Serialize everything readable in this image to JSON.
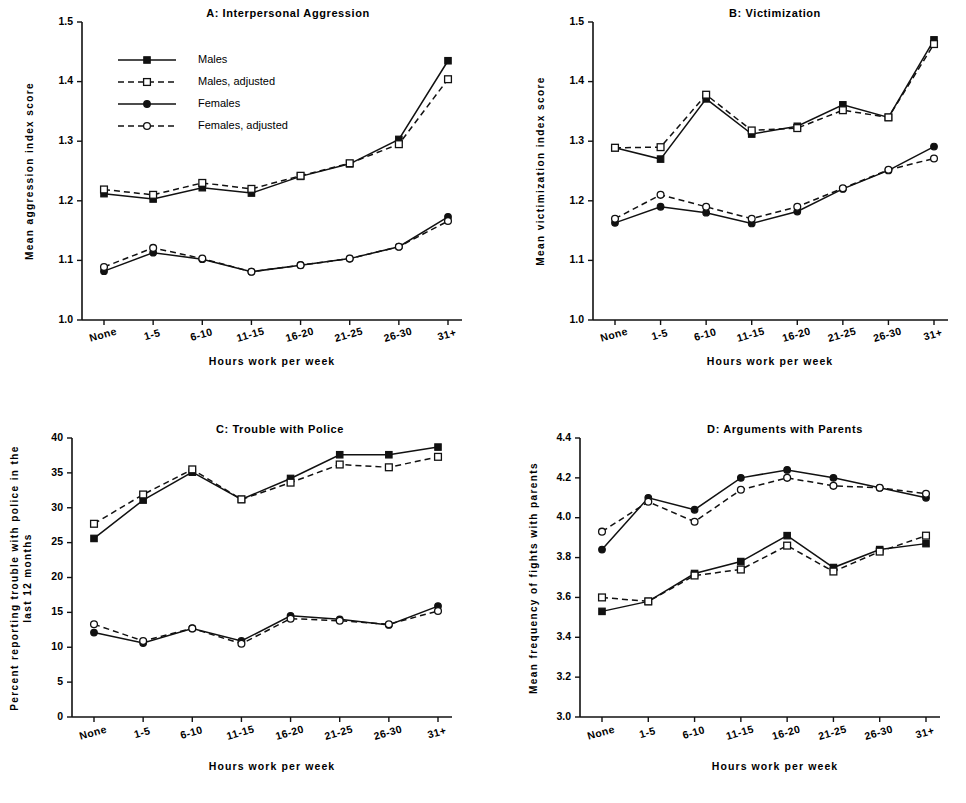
{
  "figure": {
    "shared_xlabel": "Hours work per week",
    "categories": [
      "None",
      "1-5",
      "6-10",
      "11-15",
      "16-20",
      "21-25",
      "26-30",
      "31+"
    ],
    "legend": {
      "items": [
        {
          "label": "Males",
          "marker": "filled-square",
          "line": "solid"
        },
        {
          "label": "Males, adjusted",
          "marker": "open-square",
          "line": "dashed"
        },
        {
          "label": "Females",
          "marker": "filled-circle",
          "line": "solid"
        },
        {
          "label": "Females, adjusted",
          "marker": "open-circle",
          "line": "dashed"
        }
      ]
    },
    "line_color": "#111111"
  },
  "chart_data": [
    {
      "panel": "A",
      "type": "line",
      "title": "A:   Interpersonal Aggression",
      "xlabel": "Hours work per week",
      "ylabel": "Mean aggression index score",
      "categories": [
        "None",
        "1-5",
        "6-10",
        "11-15",
        "16-20",
        "21-25",
        "26-30",
        "31+"
      ],
      "ylim": [
        1.0,
        1.5
      ],
      "yticks": [
        1.0,
        1.1,
        1.2,
        1.3,
        1.4,
        1.5
      ],
      "ytick_labels": [
        "1.0",
        "1.1",
        "1.2",
        "1.3",
        "1.4",
        "1.5"
      ],
      "grid": false,
      "legend_position": "upper-left",
      "series": [
        {
          "name": "Males",
          "marker": "filled-square",
          "line": "solid",
          "values": [
            1.212,
            1.203,
            1.222,
            1.213,
            1.241,
            1.262,
            1.303,
            1.435
          ]
        },
        {
          "name": "Males, adjusted",
          "marker": "open-square",
          "line": "dashed",
          "values": [
            1.219,
            1.21,
            1.23,
            1.22,
            1.242,
            1.263,
            1.295,
            1.404
          ]
        },
        {
          "name": "Females",
          "marker": "filled-circle",
          "line": "solid",
          "values": [
            1.082,
            1.113,
            1.102,
            1.081,
            1.092,
            1.103,
            1.123,
            1.173
          ]
        },
        {
          "name": "Females, adjusted",
          "marker": "open-circle",
          "line": "dashed",
          "values": [
            1.089,
            1.121,
            1.103,
            1.081,
            1.092,
            1.103,
            1.123,
            1.166
          ]
        }
      ]
    },
    {
      "panel": "B",
      "type": "line",
      "title": "B:   Victimization",
      "xlabel": "Hours work per week",
      "ylabel": "Mean victimization index score",
      "categories": [
        "None",
        "1-5",
        "6-10",
        "11-15",
        "16-20",
        "21-25",
        "26-30",
        "31+"
      ],
      "ylim": [
        1.0,
        1.5
      ],
      "yticks": [
        1.0,
        1.1,
        1.2,
        1.3,
        1.4,
        1.5
      ],
      "ytick_labels": [
        "1.0",
        "1.1",
        "1.2",
        "1.3",
        "1.4",
        "1.5"
      ],
      "grid": false,
      "legend_position": "none",
      "series": [
        {
          "name": "Males",
          "marker": "filled-square",
          "line": "solid",
          "values": [
            1.289,
            1.27,
            1.371,
            1.312,
            1.325,
            1.361,
            1.34,
            1.47
          ]
        },
        {
          "name": "Males, adjusted",
          "marker": "open-square",
          "line": "dashed",
          "values": [
            1.289,
            1.29,
            1.378,
            1.318,
            1.322,
            1.352,
            1.34,
            1.463
          ]
        },
        {
          "name": "Females",
          "marker": "filled-circle",
          "line": "solid",
          "values": [
            1.163,
            1.19,
            1.18,
            1.162,
            1.182,
            1.22,
            1.251,
            1.291
          ]
        },
        {
          "name": "Females, adjusted",
          "marker": "open-circle",
          "line": "dashed",
          "values": [
            1.17,
            1.21,
            1.19,
            1.17,
            1.19,
            1.221,
            1.252,
            1.271
          ]
        }
      ]
    },
    {
      "panel": "C",
      "type": "line",
      "title": "C:  Trouble with Police",
      "xlabel": "Hours work per week",
      "ylabel": "Percent reporting trouble with police in the last 12 months",
      "ylabel_lines": [
        "Percent reporting trouble with police in the",
        "last 12 months"
      ],
      "categories": [
        "None",
        "1-5",
        "6-10",
        "11-15",
        "16-20",
        "21-25",
        "26-30",
        "31+"
      ],
      "ylim": [
        0,
        40
      ],
      "yticks": [
        0,
        5,
        10,
        15,
        20,
        25,
        30,
        35,
        40
      ],
      "ytick_labels": [
        "0",
        "5",
        "10",
        "15",
        "20",
        "25",
        "30",
        "35",
        "40"
      ],
      "grid": false,
      "legend_position": "none",
      "series": [
        {
          "name": "Males",
          "marker": "filled-square",
          "line": "solid",
          "values": [
            25.6,
            31.1,
            35.1,
            31.2,
            34.2,
            37.6,
            37.6,
            38.7
          ]
        },
        {
          "name": "Males, adjusted",
          "marker": "open-square",
          "line": "dashed",
          "values": [
            27.7,
            31.9,
            35.5,
            31.2,
            33.6,
            36.2,
            35.8,
            37.3
          ]
        },
        {
          "name": "Females",
          "marker": "filled-circle",
          "line": "solid",
          "values": [
            12.1,
            10.6,
            12.7,
            10.9,
            14.5,
            14.0,
            13.2,
            15.9
          ]
        },
        {
          "name": "Females, adjusted",
          "marker": "open-circle",
          "line": "dashed",
          "values": [
            13.3,
            10.9,
            12.7,
            10.5,
            14.1,
            13.8,
            13.3,
            15.2
          ]
        }
      ]
    },
    {
      "panel": "D",
      "type": "line",
      "title": "D:   Arguments with Parents",
      "xlabel": "Hours work per week",
      "ylabel": "Mean frequency of fights with parents",
      "categories": [
        "None",
        "1-5",
        "6-10",
        "11-15",
        "16-20",
        "21-25",
        "26-30",
        "31+"
      ],
      "ylim": [
        3.0,
        4.4
      ],
      "yticks": [
        3.0,
        3.2,
        3.4,
        3.6,
        3.8,
        4.0,
        4.2,
        4.4
      ],
      "ytick_labels": [
        "3.0",
        "3.2",
        "3.4",
        "3.6",
        "3.8",
        "4.0",
        "4.2",
        "4.4"
      ],
      "grid": false,
      "legend_position": "none",
      "series": [
        {
          "name": "Males",
          "marker": "filled-square",
          "line": "solid",
          "values": [
            3.53,
            3.58,
            3.72,
            3.78,
            3.91,
            3.75,
            3.84,
            3.87
          ]
        },
        {
          "name": "Males, adjusted",
          "marker": "open-square",
          "line": "dashed",
          "values": [
            3.6,
            3.58,
            3.71,
            3.74,
            3.86,
            3.73,
            3.83,
            3.91
          ]
        },
        {
          "name": "Females",
          "marker": "filled-circle",
          "line": "solid",
          "values": [
            3.84,
            4.1,
            4.04,
            4.2,
            4.24,
            4.2,
            4.15,
            4.1
          ]
        },
        {
          "name": "Females, adjusted",
          "marker": "open-circle",
          "line": "dashed",
          "values": [
            3.93,
            4.08,
            3.98,
            4.14,
            4.2,
            4.16,
            4.15,
            4.12
          ]
        }
      ]
    }
  ]
}
